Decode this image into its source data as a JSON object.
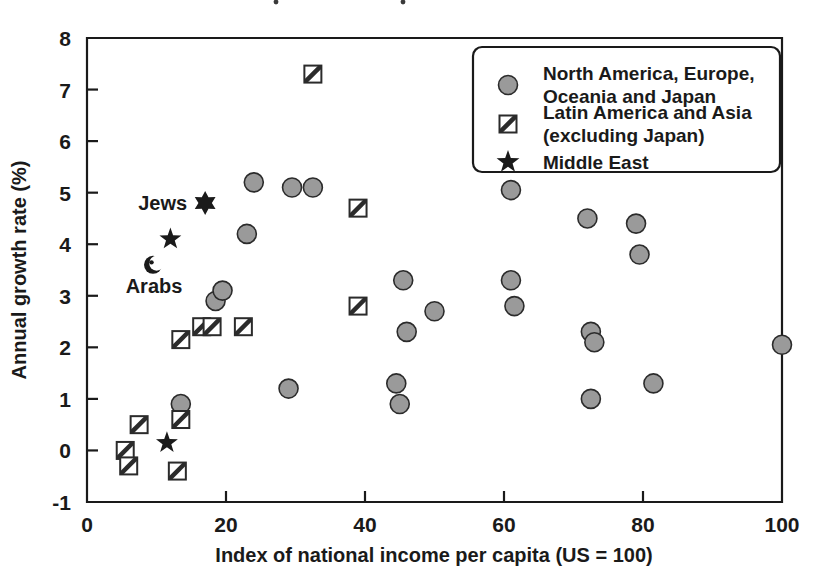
{
  "chart_data": {
    "type": "scatter",
    "title": "",
    "xlabel": "Index of national income per capita (US = 100)",
    "ylabel": "Annual growth rate (%)",
    "xlim": [
      0,
      100
    ],
    "ylim": [
      -1,
      8
    ],
    "xticks": [
      0,
      20,
      40,
      60,
      80,
      100
    ],
    "yticks": [
      -1,
      0,
      1,
      2,
      3,
      4,
      5,
      6,
      7,
      8
    ],
    "xtick_labels": [
      "0",
      "20",
      "40",
      "60",
      "80",
      "100"
    ],
    "ytick_labels": [
      "-1",
      "0",
      "1",
      "2",
      "3",
      "4",
      "5",
      "6",
      "7",
      "8"
    ],
    "grid": false,
    "legend_position": "top-right",
    "series": [
      {
        "name": "North America, Europe, Oceania and Japan",
        "marker": "circle",
        "marker_color": "#9a9a9a",
        "points": [
          [
            13.5,
            0.9
          ],
          [
            18.5,
            2.9
          ],
          [
            19.5,
            3.1
          ],
          [
            23.0,
            4.2
          ],
          [
            24.0,
            5.2
          ],
          [
            29.5,
            5.1
          ],
          [
            32.5,
            5.1
          ],
          [
            29.0,
            1.2
          ],
          [
            44.5,
            1.3
          ],
          [
            45.0,
            0.9
          ],
          [
            45.5,
            3.3
          ],
          [
            46.0,
            2.3
          ],
          [
            50.0,
            2.7
          ],
          [
            61.0,
            5.05
          ],
          [
            61.0,
            3.3
          ],
          [
            61.5,
            2.8
          ],
          [
            72.0,
            4.5
          ],
          [
            72.5,
            2.3
          ],
          [
            73.0,
            2.1
          ],
          [
            72.5,
            1.0
          ],
          [
            79.0,
            4.4
          ],
          [
            79.5,
            3.8
          ],
          [
            81.5,
            1.3
          ],
          [
            100.0,
            2.05
          ]
        ]
      },
      {
        "name": "Latin America and Asia (excluding Japan)",
        "marker": "square-hatched",
        "marker_color": "#ffffff",
        "points": [
          [
            5.5,
            0.0
          ],
          [
            6.0,
            -0.3
          ],
          [
            7.5,
            0.5
          ],
          [
            13.0,
            -0.4
          ],
          [
            13.5,
            0.6
          ],
          [
            13.5,
            2.15
          ],
          [
            16.5,
            2.4
          ],
          [
            18.0,
            2.4
          ],
          [
            22.5,
            2.4
          ],
          [
            32.5,
            7.3
          ],
          [
            39.0,
            4.7
          ],
          [
            39.0,
            2.8
          ]
        ]
      },
      {
        "name": "Middle East",
        "marker": "star",
        "marker_color": "#1a1a1a",
        "points": [
          [
            11.5,
            0.15
          ],
          [
            12.0,
            4.1
          ]
        ]
      }
    ],
    "annotations": [
      {
        "label": "Jews",
        "marker": "star-of-david",
        "x": 17.0,
        "y": 4.8,
        "label_side": "left"
      },
      {
        "label": "Arabs",
        "marker": "star-and-crescent",
        "x": 9.5,
        "y": 3.6,
        "label_side": "below"
      }
    ]
  },
  "legend": {
    "entries": [
      {
        "marker": "circle",
        "line1": "North America, Europe,",
        "line2": "Oceania and Japan"
      },
      {
        "marker": "square-hatched",
        "line1": "Latin America and Asia",
        "line2": "(excluding Japan)"
      },
      {
        "marker": "star",
        "line1": "Middle East",
        "line2": ""
      }
    ]
  }
}
